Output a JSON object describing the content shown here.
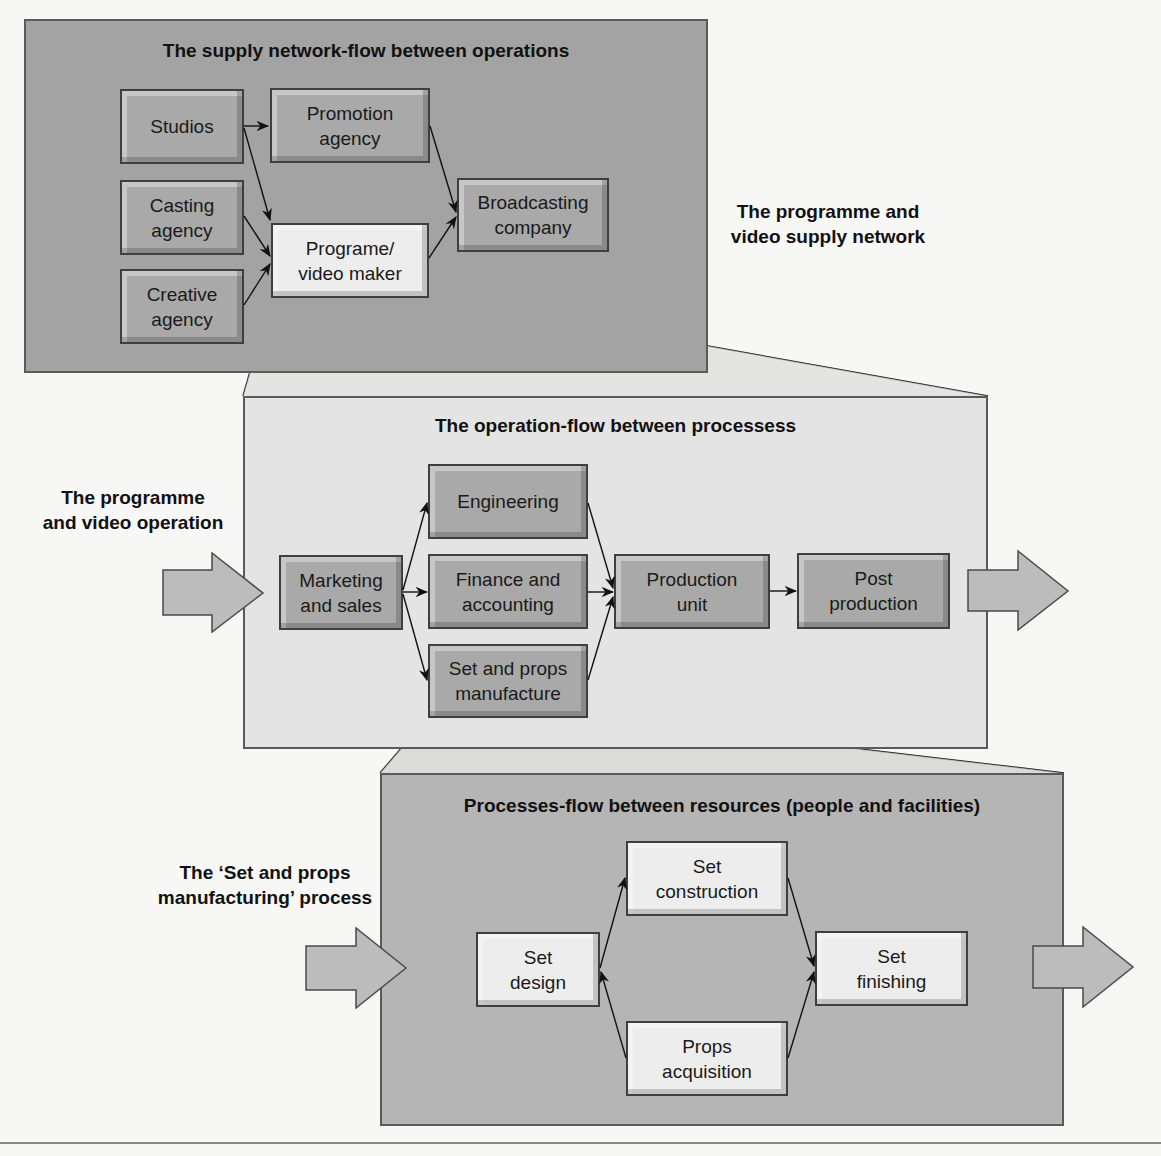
{
  "colors": {
    "background": "#f7f7f6",
    "panel_top": "#a3a3a3",
    "panel_middle": "#e4e4e4",
    "panel_bottom": "#b5b5b5",
    "box_dark": "#a9a9a9",
    "box_light": "#ededed",
    "arrow_fill": "#bcbcbc",
    "line": "#1a1a1a"
  },
  "supply_network": {
    "title": "The supply network-flow between operations",
    "side_label": "The programme and\nvideo supply network",
    "nodes": [
      {
        "id": "studios",
        "label": "Studios"
      },
      {
        "id": "casting",
        "label": "Casting\nagency"
      },
      {
        "id": "creative",
        "label": "Creative\nagency"
      },
      {
        "id": "promotion",
        "label": "Promotion\nagency"
      },
      {
        "id": "maker",
        "label": "Programe/\nvideo maker"
      },
      {
        "id": "broadcasting",
        "label": "Broadcasting\ncompany"
      }
    ],
    "edges": [
      [
        "studios",
        "promotion"
      ],
      [
        "studios",
        "maker"
      ],
      [
        "casting",
        "maker"
      ],
      [
        "creative",
        "maker"
      ],
      [
        "promotion",
        "broadcasting"
      ],
      [
        "maker",
        "broadcasting"
      ]
    ]
  },
  "operation": {
    "title": "The operation-flow between processess",
    "side_label": "The programme\nand video operation",
    "nodes": [
      {
        "id": "marketing",
        "label": "Marketing\nand sales"
      },
      {
        "id": "engineering",
        "label": "Engineering"
      },
      {
        "id": "finance",
        "label": "Finance and\naccounting"
      },
      {
        "id": "setprops",
        "label": "Set and props\nmanufacture"
      },
      {
        "id": "production",
        "label": "Production\nunit"
      },
      {
        "id": "post",
        "label": "Post\nproduction"
      }
    ],
    "edges": [
      [
        "marketing",
        "engineering"
      ],
      [
        "marketing",
        "finance"
      ],
      [
        "marketing",
        "setprops"
      ],
      [
        "engineering",
        "production"
      ],
      [
        "finance",
        "production"
      ],
      [
        "setprops",
        "production"
      ],
      [
        "production",
        "post"
      ]
    ]
  },
  "process": {
    "title": "Processes-flow between resources (people and facilities)",
    "side_label": "The ‘Set and props\nmanufacturing’ process",
    "nodes": [
      {
        "id": "design",
        "label": "Set\ndesign"
      },
      {
        "id": "construction",
        "label": "Set\nconstruction"
      },
      {
        "id": "props",
        "label": "Props\nacquisition"
      },
      {
        "id": "finishing",
        "label": "Set\nfinishing"
      }
    ],
    "edges": [
      [
        "design",
        "construction"
      ],
      [
        "props",
        "design"
      ],
      [
        "construction",
        "finishing"
      ],
      [
        "props",
        "finishing"
      ]
    ]
  }
}
